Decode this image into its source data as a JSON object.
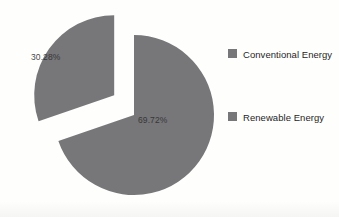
{
  "chart_data": {
    "type": "pie",
    "title": "",
    "subtitle": "",
    "xlabel": "",
    "ylabel": "",
    "grid": false,
    "legend_position": "right",
    "categories": [
      "Conventional Energy",
      "Renewable Energy"
    ],
    "values": [
      30.28,
      69.72
    ],
    "value_unit": "%",
    "data_labels": [
      "30.28%",
      "69.72%"
    ],
    "slices": [
      {
        "name": "Conventional Energy",
        "value": 30.28,
        "label": "30.28%",
        "color": "#77777a",
        "exploded": true,
        "start_angle_deg": 251,
        "end_angle_deg": 360
      },
      {
        "name": "Renewable Energy",
        "value": 69.72,
        "label": "69.72%",
        "color": "#77777a",
        "exploded": false,
        "start_angle_deg": 0,
        "end_angle_deg": 251
      }
    ],
    "colors": {
      "slice_fill": "#77777a",
      "label_text": "#2f2f2f",
      "legend_text": "#262626",
      "background": "#fefefd"
    }
  },
  "labels": {
    "conventional_pct": "30.28%",
    "renewable_pct": "69.72%"
  },
  "legend": {
    "items": [
      {
        "label": "Conventional Energy",
        "swatch_name": "legend-swatch-conventional"
      },
      {
        "label": "Renewable Energy",
        "swatch_name": "legend-swatch-renewable"
      }
    ]
  }
}
